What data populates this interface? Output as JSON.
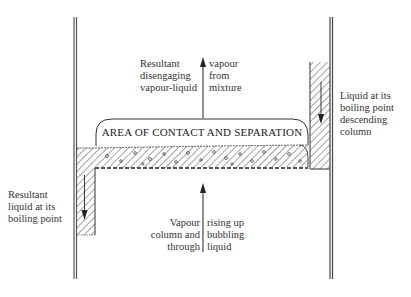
{
  "diagram": {
    "contact_area_label": "AREA OF CONTACT AND SEPARATION",
    "labels": {
      "top_left": [
        "Resultant",
        "disengaging",
        "vapour-liquid"
      ],
      "top_right": [
        "vapour",
        "from",
        "mixture"
      ],
      "right_side": [
        "Liquid at its",
        "boiling point",
        "descending",
        "column"
      ],
      "left_side": [
        "Resultant",
        "liquid at its",
        "boiling point"
      ],
      "bottom_left": [
        "Vapour",
        "column and",
        "through"
      ],
      "bottom_right": [
        "rising up",
        "bubbling",
        "liquid"
      ]
    },
    "colors": {
      "line": "#333333",
      "wall": "#555555",
      "background": "#ffffff"
    }
  }
}
